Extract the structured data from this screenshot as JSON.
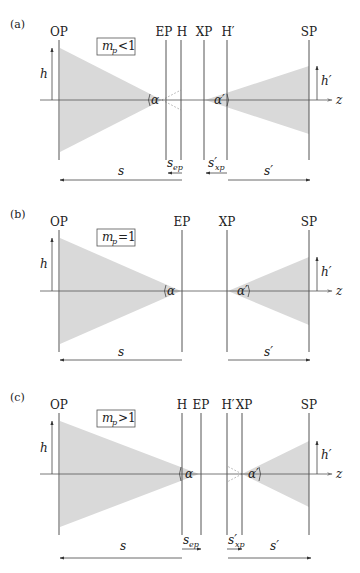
{
  "figure": {
    "panels": [
      {
        "id": "a",
        "tag": "(a)",
        "condition": {
          "symbol": "m",
          "subscript": "p",
          "relation": "<1"
        },
        "planes": [
          {
            "label": "OP",
            "x": 59
          },
          {
            "label": "EP",
            "x": 166
          },
          {
            "label": "H",
            "x": 181
          },
          {
            "label": "XP",
            "x": 204
          },
          {
            "label": "H′",
            "x": 227
          },
          {
            "label": "SP",
            "x": 309
          }
        ],
        "object_height_label": "h",
        "image_height_label": "h′",
        "angle_object": "α",
        "angle_image": "α′",
        "axis_label": "z",
        "distances": {
          "s": "s",
          "s_prime": "s′",
          "s_ep": {
            "base": "s",
            "sub": "ep",
            "direction": "left"
          },
          "s_xp": {
            "base": "s′",
            "sub": "xp",
            "direction": "left"
          }
        }
      },
      {
        "id": "b",
        "tag": "(b)",
        "condition": {
          "symbol": "m",
          "subscript": "p",
          "relation": "=1"
        },
        "planes": [
          {
            "label": "OP",
            "x": 59
          },
          {
            "label": "EP",
            "x": 182
          },
          {
            "label": "XP",
            "x": 227
          },
          {
            "label": "SP",
            "x": 309
          }
        ],
        "object_height_label": "h",
        "image_height_label": "h′",
        "angle_object": "α",
        "angle_image": "α′",
        "axis_label": "z",
        "distances": {
          "s": "s",
          "s_prime": "s′"
        }
      },
      {
        "id": "c",
        "tag": "(c)",
        "condition": {
          "symbol": "m",
          "subscript": "p",
          "relation": ">1"
        },
        "planes": [
          {
            "label": "OP",
            "x": 59
          },
          {
            "label": "H",
            "x": 182
          },
          {
            "label": "EP",
            "x": 201
          },
          {
            "label": "H′",
            "x": 227
          },
          {
            "label": "XP",
            "x": 242
          },
          {
            "label": "SP",
            "x": 309
          }
        ],
        "object_height_label": "h",
        "image_height_label": "h′",
        "angle_object": "α",
        "angle_image": "α′",
        "axis_label": "z",
        "distances": {
          "s": "s",
          "s_prime": "s′",
          "s_ep": {
            "base": "s",
            "sub": "ep",
            "direction": "right"
          },
          "s_xp": {
            "base": "s′",
            "sub": "xp",
            "direction": "right"
          }
        }
      }
    ]
  }
}
